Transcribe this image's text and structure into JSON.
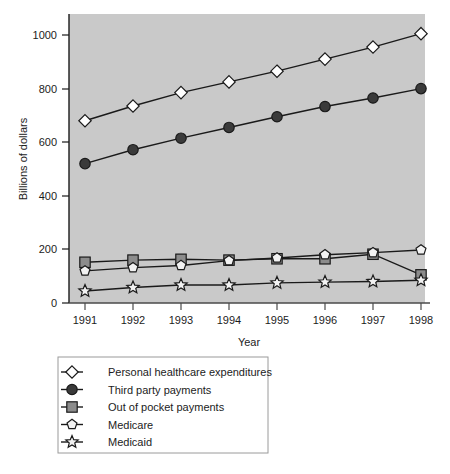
{
  "chart_data": {
    "type": "line",
    "title": "",
    "xlabel": "Year",
    "ylabel": "Billions of dollars",
    "categories": [
      "1991",
      "1992",
      "1993",
      "1994",
      "1995",
      "1996",
      "1997",
      "1998"
    ],
    "x": [
      1991,
      1992,
      1993,
      1994,
      1995,
      1996,
      1997,
      1998
    ],
    "xlim": [
      1990.5,
      1998.5
    ],
    "ylim": [
      0,
      1075
    ],
    "yticks": [
      0,
      200,
      400,
      600,
      800,
      1000
    ],
    "ytick_labels": [
      "0",
      "200",
      "400",
      "600",
      "800",
      "1000"
    ],
    "grid": false,
    "legend_position": "below-plot",
    "plot_background": "#c9c9c9",
    "series": [
      {
        "name": "Personal healthcare expenditures",
        "marker": "diamond",
        "marker_fill": "#ffffff",
        "line_color": "#1a1a1a",
        "values": [
          680,
          735,
          785,
          825,
          865,
          910,
          955,
          1005
        ]
      },
      {
        "name": "Third party payments",
        "marker": "circle",
        "marker_fill": "#3a3a3a",
        "line_color": "#1a1a1a",
        "values": [
          520,
          572,
          615,
          655,
          695,
          733,
          765,
          800
        ]
      },
      {
        "name": "Out of pocket payments",
        "marker": "square",
        "marker_fill": "#8c8c8c",
        "line_color": "#1a1a1a",
        "values": [
          152,
          160,
          163,
          160,
          165,
          165,
          182,
          105
        ]
      },
      {
        "name": "Medicare",
        "marker": "pentagon",
        "marker_fill": "#f2f2f2",
        "line_color": "#1a1a1a",
        "values": [
          120,
          132,
          140,
          158,
          168,
          180,
          188,
          198
        ]
      },
      {
        "name": "Medicaid",
        "marker": "star",
        "marker_fill": "#f2f2f2",
        "line_color": "#1a1a1a",
        "values": [
          45,
          58,
          67,
          67,
          75,
          78,
          80,
          85
        ]
      }
    ]
  },
  "axis": {
    "y_title": "Billions of dollars",
    "x_title": "Year",
    "y_ticks": [
      "1000",
      "800",
      "600",
      "400",
      "200",
      "0"
    ],
    "x_ticks": [
      "1991",
      "1992",
      "1993",
      "1994",
      "1995",
      "1996",
      "1997",
      "1998"
    ]
  },
  "legend": {
    "items": [
      {
        "label": "Personal healthcare expenditures",
        "marker": "diamond-icon"
      },
      {
        "label": "Third party payments",
        "marker": "circle-icon"
      },
      {
        "label": "Out of pocket payments",
        "marker": "square-icon"
      },
      {
        "label": "Medicare",
        "marker": "pentagon-icon"
      },
      {
        "label": "Medicaid",
        "marker": "star-icon"
      }
    ]
  },
  "caption": {
    "text": ""
  },
  "colors": {
    "plot_bg": "#c9c9c9",
    "line": "#1a1a1a",
    "text": "#1c1c1c",
    "page_bg": "#ffffff",
    "legend_border": "#9a9a9a"
  }
}
